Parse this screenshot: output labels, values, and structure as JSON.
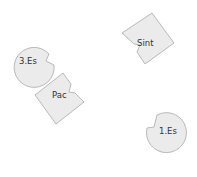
{
  "diagram": {
    "nodes": [
      {
        "id": "sint",
        "label": "Sint",
        "shape": "notched-square"
      },
      {
        "id": "3es",
        "label": "3.Es",
        "shape": "notched-circle"
      },
      {
        "id": "pac",
        "label": "Pac",
        "shape": "notched-square"
      },
      {
        "id": "1es",
        "label": "1.Es",
        "shape": "notched-circle"
      }
    ],
    "colors": {
      "fill": "#ebebeb",
      "stroke": "#a9a9a9",
      "text": "#333333",
      "background": "#ffffff"
    }
  }
}
